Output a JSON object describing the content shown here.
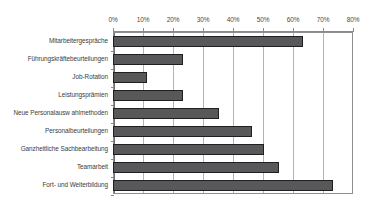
{
  "chart_data": {
    "type": "bar",
    "orientation": "horizontal",
    "title": "",
    "subtitle": "",
    "xlabel": "",
    "ylabel": "",
    "xlim": [
      0,
      80
    ],
    "grid": true,
    "legend": null,
    "tick_labels": [
      "0%",
      "10%",
      "20%",
      "30%",
      "40%",
      "50%",
      "60%",
      "70%",
      "80%"
    ],
    "tick_values": [
      0,
      10,
      20,
      30,
      40,
      50,
      60,
      70,
      80
    ],
    "categories": [
      "Mitarbeitergespräche",
      "Führungskräftebeurteilungen",
      "Job-Rotation",
      "Leistungsprämien",
      "Neue Personalausw ahlmethoden",
      "Personalbeurteilungen",
      "Ganzheitliche Sachbearbeitung",
      "Teamarbeit",
      "Fort- und Weiterbildung"
    ],
    "values": [
      63,
      23,
      11,
      23,
      35,
      46,
      50,
      55,
      73
    ],
    "unit": "%",
    "colors": {
      "bar_fill": "#58585a",
      "bar_border": "#1f1f1f",
      "gridline": "#b4b4b4",
      "axis": "#8f8f8f",
      "label_text": "#3c3c3c",
      "plot_background": "#ffffff"
    }
  }
}
